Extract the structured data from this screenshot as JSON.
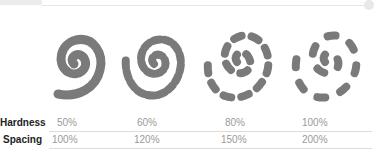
{
  "header": {
    "has_slider_track": true
  },
  "samples": [
    {
      "id": "brush-50",
      "style": "continuous"
    },
    {
      "id": "brush-60",
      "style": "dashed-dense"
    },
    {
      "id": "brush-80",
      "style": "dashed-sparse"
    },
    {
      "id": "brush-100",
      "style": "dashed-very-sparse"
    }
  ],
  "table": {
    "rows": [
      {
        "label": "Hardness",
        "values": [
          "50%",
          "60%",
          "80%",
          "100%"
        ]
      },
      {
        "label": "Spacing",
        "values": [
          "100%",
          "120%",
          "150%",
          "200%"
        ]
      }
    ]
  },
  "colors": {
    "stroke": "#7a7a7a",
    "label": "#222222",
    "value": "#9a9a9a",
    "rule": "#dcdcdc"
  }
}
